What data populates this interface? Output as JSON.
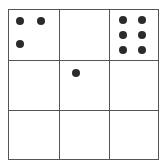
{
  "grid": {
    "rows": 3,
    "cols": 3,
    "line_color": "#555555"
  },
  "dot_color": "#2b2b2b",
  "cells": [
    {
      "row": 0,
      "col": 0,
      "dots": 3
    },
    {
      "row": 0,
      "col": 1,
      "dots": 0
    },
    {
      "row": 0,
      "col": 2,
      "dots": 6
    },
    {
      "row": 1,
      "col": 0,
      "dots": 0
    },
    {
      "row": 1,
      "col": 1,
      "dots": 1
    },
    {
      "row": 1,
      "col": 2,
      "dots": 0
    },
    {
      "row": 2,
      "col": 0,
      "dots": 0
    },
    {
      "row": 2,
      "col": 1,
      "dots": 0
    },
    {
      "row": 2,
      "col": 2,
      "dots": 0
    }
  ]
}
